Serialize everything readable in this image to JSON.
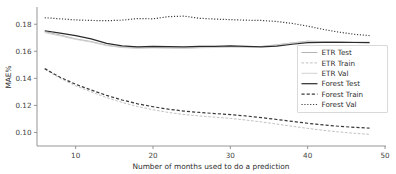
{
  "chart_data": {
    "type": "line",
    "title": "",
    "xlabel": "Number of months used to do a prediction",
    "ylabel": "MAE%",
    "xlim": [
      5,
      50
    ],
    "ylim": [
      0.09,
      0.192
    ],
    "xticks": [
      10,
      20,
      30,
      40,
      50
    ],
    "xtick_labels": [
      "10",
      "20",
      "30",
      "40",
      "50"
    ],
    "yticks": [
      0.1,
      0.12,
      0.14,
      0.16,
      0.18
    ],
    "ytick_labels": [
      "0.10",
      "0.12",
      "0.14",
      "0.16",
      "0.18"
    ],
    "grid": false,
    "legend_position": "center-right",
    "x": [
      6,
      8,
      10,
      12,
      14,
      16,
      18,
      20,
      22,
      24,
      26,
      28,
      30,
      32,
      34,
      36,
      38,
      40,
      42,
      44,
      46,
      48
    ],
    "series": [
      {
        "name": "ETR Test",
        "color": "#b4b4b4",
        "style": "solid",
        "width": 1.0,
        "values": [
          0.1745,
          0.172,
          0.1692,
          0.1672,
          0.1645,
          0.163,
          0.1625,
          0.1628,
          0.1626,
          0.1624,
          0.1628,
          0.163,
          0.1634,
          0.1632,
          0.1636,
          0.1648,
          0.1662,
          0.1675,
          0.1672,
          0.167,
          0.1668,
          0.1667
        ]
      },
      {
        "name": "ETR Train",
        "color": "#c0c0c0",
        "style": "dashed",
        "width": 1.0,
        "values": [
          0.1468,
          0.14,
          0.1345,
          0.13,
          0.1258,
          0.1222,
          0.1192,
          0.1168,
          0.1148,
          0.1133,
          0.1122,
          0.1113,
          0.1104,
          0.1092,
          0.1078,
          0.1062,
          0.1046,
          0.103,
          0.1016,
          0.1004,
          0.0994,
          0.0986
        ]
      },
      {
        "name": "ETR Val",
        "color": "#d2d2d2",
        "style": "solid",
        "width": 1.0,
        "values": [
          0.1738,
          0.1714,
          0.1688,
          0.1668,
          0.1642,
          0.1628,
          0.1622,
          0.1625,
          0.1623,
          0.1622,
          0.1626,
          0.1628,
          0.1632,
          0.163,
          0.1634,
          0.1646,
          0.166,
          0.1673,
          0.167,
          0.1668,
          0.1666,
          0.1665
        ]
      },
      {
        "name": "Forest Test",
        "color": "#2b2b2b",
        "style": "solid",
        "width": 1.2,
        "values": [
          0.1752,
          0.1734,
          0.1716,
          0.1692,
          0.1658,
          0.164,
          0.1633,
          0.1636,
          0.1634,
          0.1632,
          0.1636,
          0.1637,
          0.164,
          0.1636,
          0.1632,
          0.1638,
          0.1652,
          0.1664,
          0.1666,
          0.1666,
          0.1665,
          0.1664
        ]
      },
      {
        "name": "Forest Train",
        "color": "#3a3a3a",
        "style": "dashed",
        "width": 1.2,
        "values": [
          0.1472,
          0.1408,
          0.1356,
          0.1314,
          0.1274,
          0.124,
          0.1212,
          0.119,
          0.1172,
          0.1158,
          0.1148,
          0.114,
          0.1132,
          0.1122,
          0.111,
          0.1096,
          0.1082,
          0.1068,
          0.1056,
          0.1046,
          0.1038,
          0.1032
        ]
      },
      {
        "name": "Forest Val",
        "color": "#3a3a3a",
        "style": "dotted",
        "width": 1.2,
        "values": [
          0.1848,
          0.184,
          0.1832,
          0.1828,
          0.1826,
          0.183,
          0.1842,
          0.184,
          0.1856,
          0.186,
          0.1844,
          0.1838,
          0.1834,
          0.183,
          0.1828,
          0.182,
          0.1806,
          0.1786,
          0.1762,
          0.1742,
          0.1726,
          0.1716
        ]
      }
    ]
  },
  "legend": {
    "entries": [
      {
        "label": "ETR Test"
      },
      {
        "label": "ETR Train"
      },
      {
        "label": "ETR Val"
      },
      {
        "label": "Forest Test"
      },
      {
        "label": "Forest Train"
      },
      {
        "label": "Forest Val"
      }
    ]
  }
}
